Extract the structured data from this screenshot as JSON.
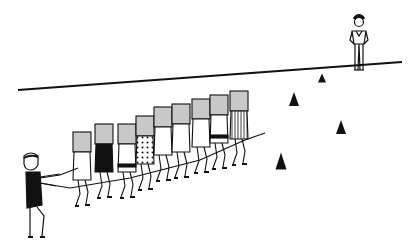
{
  "illustration": {
    "description": "Line drawing: a leader pulls a line of ten children holding boards overhead toward a standing figure past cones",
    "colors": {
      "ink": "#111111",
      "board": "#c8c8c8",
      "background": "#ffffff"
    },
    "field_line": {
      "x1": 18,
      "y1": 90,
      "x2": 402,
      "y2": 62
    },
    "cones": [
      {
        "x": 322,
        "y": 78,
        "w": 8,
        "h": 9
      },
      {
        "x": 294,
        "y": 99,
        "w": 10,
        "h": 14
      },
      {
        "x": 341,
        "y": 127,
        "w": 10,
        "h": 14
      },
      {
        "x": 281,
        "y": 161,
        "w": 11,
        "h": 17
      }
    ],
    "carriers": [
      {
        "x": 73,
        "top": 132,
        "fill": "none"
      },
      {
        "x": 95,
        "top": 124,
        "fill": "solid"
      },
      {
        "x": 118,
        "top": 124,
        "fill": "belt"
      },
      {
        "x": 136,
        "top": 116,
        "fill": "dots"
      },
      {
        "x": 154,
        "top": 107,
        "fill": "none"
      },
      {
        "x": 172,
        "top": 104,
        "fill": "none"
      },
      {
        "x": 192,
        "top": 99,
        "fill": "none"
      },
      {
        "x": 210,
        "top": 95,
        "fill": "belt"
      },
      {
        "x": 230,
        "top": 91,
        "fill": "stripes"
      }
    ]
  }
}
